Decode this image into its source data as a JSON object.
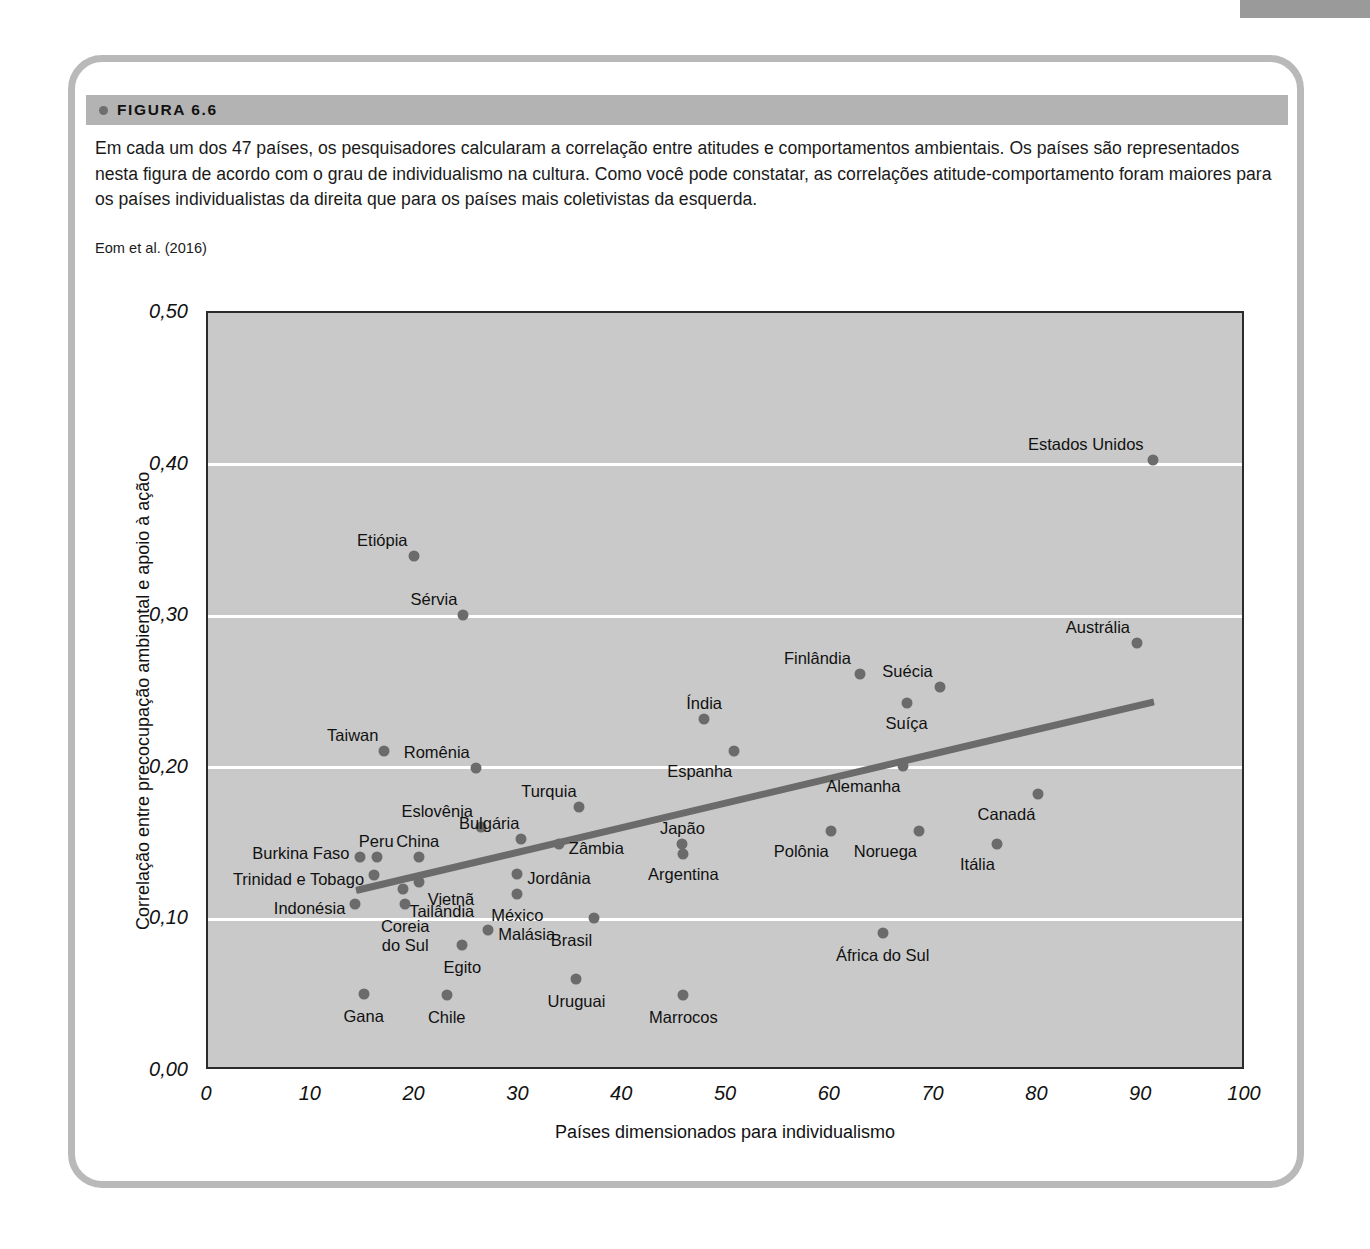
{
  "figure": {
    "label": "FIGURA 6.6",
    "caption": "Em cada um dos 47 países, os pesquisadores calcularam a correlação entre atitudes e comportamentos ambientais. Os países são representados nesta figura de acordo com o grau de individualismo na cultura. Como você pode constatar, as correlações atitude-comportamento foram maiores para os países individualistas da direita que para os países mais coletivistas da esquerda.",
    "source": "Eom et al. (2016)"
  },
  "colors": {
    "plot_background": "#c9c9c9",
    "point": "#6b6b6b",
    "trendline": "#6b6b6b",
    "gridline": "#ffffff",
    "header_band": "#b3b3b3",
    "frame_border": "#b9b9b9"
  },
  "chart_data": {
    "type": "scatter",
    "title": "",
    "xlabel": "Países dimensionados para individualismo",
    "ylabel": "Correlação entre precocupação ambiental e apoio à ação",
    "xlim": [
      0,
      100
    ],
    "ylim": [
      0.0,
      0.5
    ],
    "xticks": [
      "0",
      "10",
      "20",
      "30",
      "40",
      "50",
      "60",
      "70",
      "80",
      "90",
      "100"
    ],
    "xtick_values": [
      0,
      10,
      20,
      30,
      40,
      50,
      60,
      70,
      80,
      90,
      100
    ],
    "yticks": [
      "0,00",
      "0,10",
      "0,20",
      "0,30",
      "0,40",
      "0,50"
    ],
    "ytick_values": [
      0.0,
      0.1,
      0.2,
      0.3,
      0.4,
      0.5
    ],
    "grid": "horizontal",
    "gridline_values": [
      0.1,
      0.2,
      0.3,
      0.4
    ],
    "legend": "none",
    "trendline": {
      "x0": 14.3,
      "y0": 0.119,
      "x1": 91.2,
      "y1": 0.2435
    },
    "points": [
      {
        "name": "Estados Unidos",
        "x": 91.0,
        "y": 0.403,
        "lx": -9,
        "ly": -16,
        "align": "r"
      },
      {
        "name": "Austrália",
        "x": 89.5,
        "y": 0.282,
        "lx": -7,
        "ly": -16,
        "align": "r"
      },
      {
        "name": "Etiópia",
        "x": 19.8,
        "y": 0.34,
        "lx": -6,
        "ly": -16,
        "align": "r"
      },
      {
        "name": "Sérvia",
        "x": 24.6,
        "y": 0.301,
        "lx": -6,
        "ly": -16,
        "align": "r"
      },
      {
        "name": "Finlândia",
        "x": 62.8,
        "y": 0.262,
        "lx": -9,
        "ly": -16,
        "align": "r"
      },
      {
        "name": "Suécia",
        "x": 70.5,
        "y": 0.253,
        "lx": -7,
        "ly": -16,
        "align": "r"
      },
      {
        "name": "Suíça",
        "x": 67.3,
        "y": 0.243,
        "lx": 0,
        "ly": 20,
        "align": "c"
      },
      {
        "name": "Índia",
        "x": 47.8,
        "y": 0.232,
        "lx": 0,
        "ly": -16,
        "align": "c"
      },
      {
        "name": "Espanha",
        "x": 50.7,
        "y": 0.211,
        "lx": -2,
        "ly": 20,
        "align": "r"
      },
      {
        "name": "Taiwan",
        "x": 17.0,
        "y": 0.211,
        "lx": -6,
        "ly": -16,
        "align": "r"
      },
      {
        "name": "Alemanha",
        "x": 67.0,
        "y": 0.201,
        "lx": -3,
        "ly": 20,
        "align": "r"
      },
      {
        "name": "Romênia",
        "x": 25.8,
        "y": 0.2,
        "lx": -6,
        "ly": -16,
        "align": "r"
      },
      {
        "name": "Canadá",
        "x": 80.0,
        "y": 0.183,
        "lx": -3,
        "ly": 20,
        "align": "r"
      },
      {
        "name": "Turquia",
        "x": 35.7,
        "y": 0.174,
        "lx": -2,
        "ly": -16,
        "align": "r"
      },
      {
        "name": "Eslovênia",
        "x": 26.3,
        "y": 0.161,
        "lx": -8,
        "ly": -16,
        "align": "r"
      },
      {
        "name": "Polônia",
        "x": 60.0,
        "y": 0.158,
        "lx": -2,
        "ly": 20,
        "align": "r"
      },
      {
        "name": "Noruega",
        "x": 68.5,
        "y": 0.158,
        "lx": -2,
        "ly": 20,
        "align": "r"
      },
      {
        "name": "Bulgária",
        "x": 30.2,
        "y": 0.153,
        "lx": -2,
        "ly": -16,
        "align": "r"
      },
      {
        "name": "Zâmbia",
        "x": 33.8,
        "y": 0.15,
        "lx": 10,
        "ly": 4,
        "align": "l"
      },
      {
        "name": "Itália",
        "x": 76.0,
        "y": 0.15,
        "lx": -2,
        "ly": 20,
        "align": "r"
      },
      {
        "name": "Japão",
        "x": 45.7,
        "y": 0.15,
        "lx": 0,
        "ly": -16,
        "align": "c"
      },
      {
        "name": "Argentina",
        "x": 45.8,
        "y": 0.143,
        "lx": 0,
        "ly": 20,
        "align": "c"
      },
      {
        "name": "Peru",
        "x": 16.3,
        "y": 0.141,
        "lx": -1,
        "ly": -16,
        "align": "c"
      },
      {
        "name": "Burkina Faso",
        "x": 14.6,
        "y": 0.141,
        "lx": -10,
        "ly": -4,
        "align": "r"
      },
      {
        "name": "China",
        "x": 20.3,
        "y": 0.141,
        "lx": -1,
        "ly": -16,
        "align": "c"
      },
      {
        "name": "Trinidad e Tobago",
        "x": 16.0,
        "y": 0.129,
        "lx": -10,
        "ly": 4,
        "align": "r"
      },
      {
        "name": "Jordânia",
        "x": 29.8,
        "y": 0.13,
        "lx": 10,
        "ly": 4,
        "align": "l"
      },
      {
        "name": "Vietnã",
        "x": 20.3,
        "y": 0.125,
        "lx": 9,
        "ly": 17,
        "align": "l"
      },
      {
        "name": "Tailândia",
        "x": 18.8,
        "y": 0.12,
        "lx": 6,
        "ly": 22,
        "align": "l"
      },
      {
        "name": "México",
        "x": 29.8,
        "y": 0.117,
        "lx": 0,
        "ly": 21,
        "align": "c"
      },
      {
        "name": "Indonésia",
        "x": 14.2,
        "y": 0.11,
        "lx": -10,
        "ly": 4,
        "align": "r"
      },
      {
        "name": "Brasil",
        "x": 37.2,
        "y": 0.101,
        "lx": -2,
        "ly": 22,
        "align": "r"
      },
      {
        "name": "Coreia do Sul",
        "x": 19.0,
        "y": 0.11,
        "lx": 0,
        "ly": 22,
        "align": "c"
      },
      {
        "name": "Malásia",
        "x": 27.0,
        "y": 0.093,
        "lx": 10,
        "ly": 4,
        "align": "l"
      },
      {
        "name": "África do Sul",
        "x": 65.0,
        "y": 0.091,
        "lx": 0,
        "ly": 22,
        "align": "c"
      },
      {
        "name": "Egito",
        "x": 24.5,
        "y": 0.083,
        "lx": 0,
        "ly": 22,
        "align": "c"
      },
      {
        "name": "Uruguai",
        "x": 35.5,
        "y": 0.061,
        "lx": 0,
        "ly": 22,
        "align": "c"
      },
      {
        "name": "Gana",
        "x": 15.0,
        "y": 0.051,
        "lx": 0,
        "ly": 22,
        "align": "c"
      },
      {
        "name": "Chile",
        "x": 23.0,
        "y": 0.05,
        "lx": 0,
        "ly": 22,
        "align": "c"
      },
      {
        "name": "Marrocos",
        "x": 45.8,
        "y": 0.05,
        "lx": 0,
        "ly": 22,
        "align": "c"
      }
    ]
  }
}
